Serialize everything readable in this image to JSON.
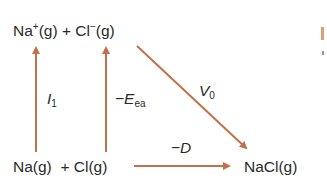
{
  "diagram": {
    "type": "born-haber-cycle",
    "arrow_color": "#c0714a",
    "species": {
      "top": {
        "na_ion": "Na",
        "na_charge": "+",
        "na_state": "(g)",
        "plus": "+",
        "cl_ion": "Cl",
        "cl_charge": "−",
        "cl_state": "(g)"
      },
      "bottom_left": {
        "na_atom": "Na(g)",
        "plus": "+",
        "cl_atom": "Cl(g)"
      },
      "bottom_right": "NaCl(g)"
    },
    "arrows": [
      {
        "id": "ionization",
        "label_main": "I",
        "label_sub": "1",
        "direction": "up"
      },
      {
        "id": "electron-affinity",
        "label_main": "−E",
        "label_sub": "ea",
        "direction": "up"
      },
      {
        "id": "lattice",
        "label_main": "V",
        "label_sub": "0",
        "direction": "down-right"
      },
      {
        "id": "dissociation",
        "label_main": "−D",
        "label_sub": "",
        "direction": "right"
      }
    ]
  }
}
